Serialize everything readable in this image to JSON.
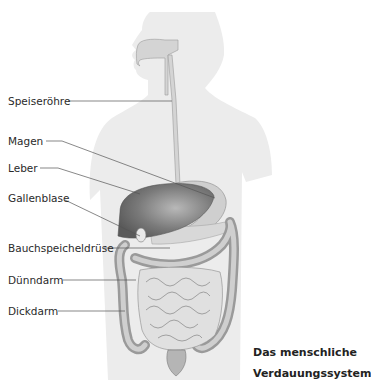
{
  "figure": {
    "caption": {
      "line1": "Das menschliche",
      "line2": "Verdauungssystem"
    },
    "labels": [
      {
        "id": "speiseroehre",
        "text": "Speiseröhre",
        "x": 8,
        "y": 96
      },
      {
        "id": "magen",
        "text": "Magen",
        "x": 8,
        "y": 136
      },
      {
        "id": "leber",
        "text": "Leber",
        "x": 8,
        "y": 163
      },
      {
        "id": "gallenblase",
        "text": "Gallenblase",
        "x": 8,
        "y": 193
      },
      {
        "id": "bauchspeicheldruese",
        "text": "Bauchspeicheldrüse",
        "x": 8,
        "y": 243
      },
      {
        "id": "duenndarm",
        "text": "Dünndarm",
        "x": 8,
        "y": 275
      },
      {
        "id": "dickdarm",
        "text": "Dickdarm",
        "x": 8,
        "y": 306
      }
    ],
    "colors": {
      "body_silhouette": "#ececec",
      "organ_fill": "#c9c9c9",
      "liver_fill": "#7d7d7d",
      "intestine_fill": "#dadada",
      "colon_fill": "#a8a8a8",
      "leader_line": "#555555"
    }
  }
}
